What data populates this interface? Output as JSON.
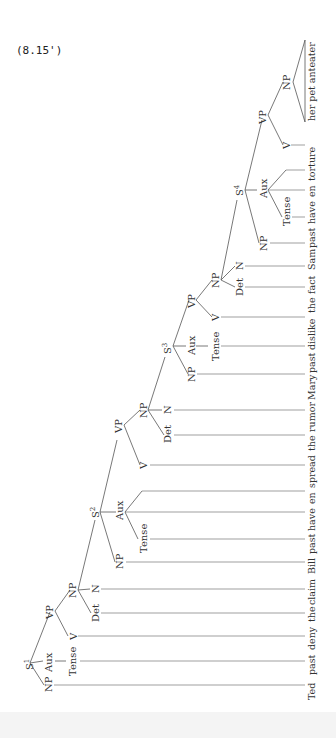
{
  "caption": "(8.15')",
  "sentence": {
    "words": [
      "Ted",
      "past",
      "deny",
      "the",
      "claim",
      "Bill",
      "past",
      "have",
      "en",
      "spread",
      "the",
      "rumor",
      "Mary",
      "past",
      "dislike",
      "the",
      "fact",
      "Sam",
      "past",
      "have",
      "en",
      "torture",
      "her pet anteater"
    ]
  },
  "nodes": {
    "s1": {
      "label": "S",
      "sup": "1"
    },
    "s1_np": "NP",
    "s1_aux": "Aux",
    "s1_tense": "Tense",
    "s1_vp": "VP",
    "s1_v": "V",
    "s1_obj_np": "NP",
    "s1_det": "Det",
    "s1_n": "N",
    "s2": {
      "label": "S",
      "sup": "2"
    },
    "s2_np": "NP",
    "s2_aux": "Aux",
    "s2_tense": "Tense",
    "s2_vp": "VP",
    "s2_v": "V",
    "s2_obj_np": "NP",
    "s2_det": "Det",
    "s2_n": "N",
    "s3": {
      "label": "S",
      "sup": "3"
    },
    "s3_np": "NP",
    "s3_aux": "Aux",
    "s3_tense": "Tense",
    "s3_vp": "VP",
    "s3_v": "V",
    "s3_obj_np": "NP",
    "s3_det": "Det",
    "s3_n": "N",
    "s4": {
      "label": "S",
      "sup": "4"
    },
    "s4_np": "NP",
    "s4_aux": "Aux",
    "s4_tense": "Tense",
    "s4_vp": "VP",
    "s4_v": "V",
    "s4_obj_np": "NP"
  },
  "colors": {
    "background": "#ffffff",
    "ink": "#333333"
  }
}
